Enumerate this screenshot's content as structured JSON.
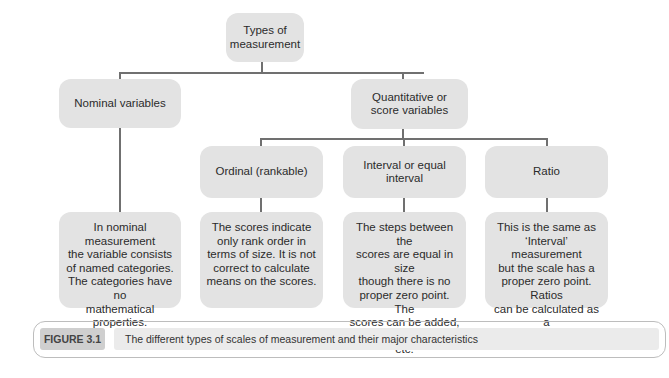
{
  "diagram": {
    "root": {
      "label": "Types of measurement",
      "lines": [
        "Types of",
        "measurement"
      ]
    },
    "level1": [
      {
        "label": "Nominal variables",
        "lines": [
          "Nominal variables"
        ]
      },
      {
        "label": "Quantitative or score variables",
        "lines": [
          "Quantitative or",
          "score variables"
        ]
      }
    ],
    "level2": [
      {
        "label": "Ordinal (rankable)",
        "lines": [
          "Ordinal (rankable)"
        ]
      },
      {
        "label": "Interval or equal interval",
        "lines": [
          "Interval or equal",
          "interval"
        ]
      },
      {
        "label": "Ratio",
        "lines": [
          "Ratio"
        ]
      }
    ],
    "descriptions": [
      {
        "for": "Nominal variables",
        "lines": [
          "In nominal measurement",
          "the variable consists",
          "of named categories.",
          "The categories have no",
          "mathematical properties."
        ]
      },
      {
        "for": "Ordinal (rankable)",
        "lines": [
          "The scores indicate",
          "only rank order in",
          "terms of size. It is not",
          "correct to calculate",
          "means on the scores."
        ]
      },
      {
        "for": "Interval or equal interval",
        "lines": [
          "The steps between the",
          "scores are equal in size",
          "though there is no",
          "proper zero point. The",
          "scores can be added,",
          "means calculated, etc."
        ]
      },
      {
        "for": "Ratio",
        "lines": [
          "This is the same as",
          "‘Interval’ measurement",
          "but the scale has a",
          "proper zero point. Ratios",
          "can be calculated as a",
          "consequence."
        ]
      }
    ]
  },
  "caption": {
    "label": "FIGURE 3.1",
    "text": "The different types of scales of measurement and their major characteristics"
  },
  "colors": {
    "box_fill": "#e3e3e3",
    "connector": "#707070",
    "label_fill": "#cfcfcf",
    "caption_fill": "#ebebeb"
  }
}
